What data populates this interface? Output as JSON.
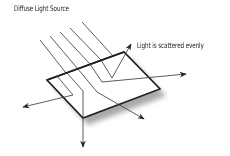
{
  "diagram": {
    "labels": {
      "source": "Diffuse Light Source",
      "scatter": "Light is scattered evenly"
    },
    "colors": {
      "line": "#222222",
      "ray": "#333333",
      "shadow": "#9a9a9a",
      "background": "#ffffff"
    },
    "surface": {
      "corners": [
        [
          47,
          80
        ],
        [
          124,
          52
        ],
        [
          160,
          89
        ],
        [
          83,
          118
        ]
      ]
    },
    "incoming_rays": [
      {
        "from": [
          40,
          40
        ],
        "to": [
          66,
          73
        ]
      },
      {
        "from": [
          50,
          36
        ],
        "to": [
          78,
          69
        ]
      },
      {
        "from": [
          60,
          32
        ],
        "to": [
          90,
          64
        ]
      },
      {
        "from": [
          70,
          28
        ],
        "to": [
          102,
          60
        ]
      },
      {
        "from": [
          82,
          22
        ],
        "to": [
          113,
          56
        ]
      }
    ],
    "scattered_rays": [
      {
        "name": "up",
        "points": [
          [
            100,
            60
          ],
          [
            113,
            80
          ],
          [
            131,
            45
          ]
        ]
      },
      {
        "name": "right",
        "points": [
          [
            90,
            64
          ],
          [
            109,
            82
          ],
          [
            185,
            74
          ]
        ]
      },
      {
        "name": "down-right",
        "points": [
          [
            78,
            69
          ],
          [
            100,
            90
          ],
          [
            143,
            118
          ]
        ]
      },
      {
        "name": "down",
        "points": [
          [
            68,
            73
          ],
          [
            83,
            90
          ],
          [
            83,
            146
          ]
        ]
      },
      {
        "name": "left",
        "points": [
          [
            57,
            76
          ],
          [
            72,
            94
          ],
          [
            24,
            107
          ]
        ]
      }
    ]
  }
}
